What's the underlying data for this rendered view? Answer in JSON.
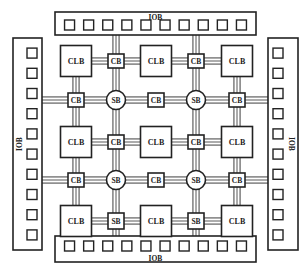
{
  "diagram": {
    "labels": {
      "iob": "IOB",
      "clb": "CLB",
      "sb": "SB",
      "cb": "CB"
    },
    "iob_banks": [
      {
        "side": "top",
        "pads": 10,
        "label": "IOB"
      },
      {
        "side": "bottom",
        "pads": 10,
        "label": "IOB"
      },
      {
        "side": "left",
        "pads": 10,
        "label": "IOB"
      },
      {
        "side": "right",
        "pads": 10,
        "label": "IOB"
      }
    ],
    "clb_grid": {
      "rows": 3,
      "cols": 3
    },
    "switch_boxes": [
      {
        "id": "sb-1",
        "label": "SB",
        "shape": "circle"
      },
      {
        "id": "sb-2",
        "label": "SB",
        "shape": "circle"
      },
      {
        "id": "sb-3",
        "label": "SB",
        "shape": "circle"
      },
      {
        "id": "sb-4",
        "label": "SB",
        "shape": "circle"
      },
      {
        "id": "sb-5",
        "label": "SB",
        "shape": "square"
      },
      {
        "id": "sb-6",
        "label": "SB",
        "shape": "square"
      }
    ],
    "connection_boxes": [
      {
        "id": "cb-1",
        "label": "CB"
      },
      {
        "id": "cb-2",
        "label": "CB"
      },
      {
        "id": "cb-3",
        "label": "CB"
      },
      {
        "id": "cb-4",
        "label": "CB"
      },
      {
        "id": "cb-5",
        "label": "CB"
      },
      {
        "id": "cb-6",
        "label": "CB"
      },
      {
        "id": "cb-7",
        "label": "CB"
      },
      {
        "id": "cb-8",
        "label": "CB"
      },
      {
        "id": "cb-9",
        "label": "CB"
      }
    ],
    "colors": {
      "stroke": "#222222",
      "background": "#ffffff"
    }
  }
}
